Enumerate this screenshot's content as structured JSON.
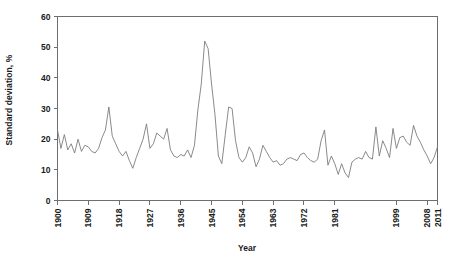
{
  "chart_data": {
    "type": "line",
    "title": "",
    "xlabel": "Year",
    "ylabel": "Standard deviation, %",
    "xlim": [
      1900,
      2011
    ],
    "ylim": [
      0,
      60
    ],
    "grid": false,
    "legend": null,
    "line_color": "#7d7d7d",
    "axis_color": "#6e6e6e",
    "yticks": [
      0,
      10,
      20,
      30,
      40,
      50,
      60
    ],
    "ytick_labels": [
      "0",
      "10",
      "20",
      "30",
      "40",
      "50",
      "60"
    ],
    "xticks": [
      1900,
      1909,
      1918,
      1927,
      1936,
      1945,
      1954,
      1963,
      1972,
      1981,
      1999,
      2008,
      2011
    ],
    "xtick_labels": [
      "1900",
      "1909",
      "1918",
      "1927",
      "1936",
      "1945",
      "1954",
      "1963",
      "1972",
      "1981",
      "1999",
      "2008",
      "2011"
    ],
    "x": [
      1900,
      1901,
      1902,
      1903,
      1904,
      1905,
      1906,
      1907,
      1908,
      1909,
      1910,
      1911,
      1912,
      1913,
      1914,
      1915,
      1916,
      1917,
      1918,
      1919,
      1920,
      1921,
      1922,
      1923,
      1924,
      1925,
      1926,
      1927,
      1928,
      1929,
      1930,
      1931,
      1932,
      1933,
      1934,
      1935,
      1936,
      1937,
      1938,
      1939,
      1940,
      1941,
      1942,
      1943,
      1944,
      1945,
      1946,
      1947,
      1948,
      1949,
      1950,
      1951,
      1952,
      1953,
      1954,
      1955,
      1956,
      1957,
      1958,
      1959,
      1960,
      1961,
      1962,
      1963,
      1964,
      1965,
      1966,
      1967,
      1968,
      1969,
      1970,
      1971,
      1972,
      1973,
      1974,
      1975,
      1976,
      1977,
      1978,
      1979,
      1980,
      1981,
      1982,
      1983,
      1984,
      1985,
      1986,
      1987,
      1988,
      1989,
      1990,
      1991,
      1992,
      1993,
      1994,
      1995,
      1996,
      1997,
      1998,
      1999,
      2000,
      2001,
      2002,
      2003,
      2004,
      2005,
      2006,
      2007,
      2008,
      2009,
      2010,
      2011
    ],
    "values": [
      23.0,
      17.0,
      21.5,
      16.5,
      18.5,
      15.5,
      20.0,
      16.0,
      18.0,
      17.5,
      16.0,
      15.5,
      17.0,
      20.5,
      23.0,
      30.5,
      21.0,
      18.5,
      16.0,
      14.5,
      16.0,
      13.0,
      10.5,
      14.0,
      17.0,
      20.0,
      25.0,
      17.0,
      18.5,
      22.0,
      21.0,
      20.0,
      23.5,
      16.5,
      14.5,
      14.0,
      15.0,
      14.5,
      16.5,
      14.0,
      18.0,
      29.5,
      38.0,
      52.0,
      49.5,
      38.0,
      28.0,
      14.5,
      12.0,
      21.5,
      30.5,
      30.0,
      19.5,
      14.0,
      12.5,
      14.0,
      17.5,
      15.5,
      11.0,
      13.5,
      18.0,
      16.0,
      14.0,
      12.5,
      13.0,
      11.5,
      12.0,
      13.5,
      14.0,
      13.5,
      13.0,
      15.0,
      15.5,
      14.0,
      13.0,
      12.5,
      13.5,
      19.5,
      23.0,
      11.5,
      14.5,
      12.0,
      8.5,
      12.0,
      9.0,
      7.5,
      12.5,
      13.5,
      14.0,
      13.5,
      16.0,
      14.0,
      13.5,
      24.0,
      14.5,
      19.5,
      17.0,
      14.0,
      23.5,
      17.0,
      20.5,
      21.0,
      19.0,
      18.0,
      24.5,
      21.0,
      19.0,
      16.5,
      14.5,
      12.0,
      14.0,
      17.5
    ]
  }
}
